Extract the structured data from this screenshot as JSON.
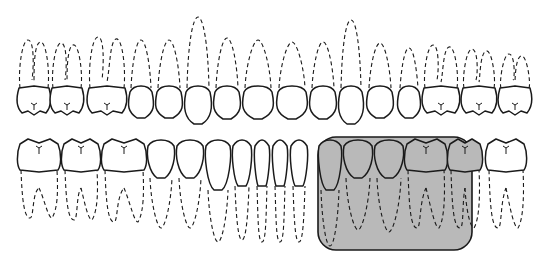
{
  "diagram": {
    "type": "dental-arch-chart",
    "colors": {
      "background": "#ffffff",
      "outline": "#1a1a1a",
      "highlight_fill": "#b9b9b9"
    },
    "upper_arch": {
      "tooth_count": 16,
      "teeth": [
        {
          "x": 18,
          "w": 32,
          "type": "molar",
          "root_top": 40
        },
        {
          "x": 51,
          "w": 32,
          "type": "molar",
          "root_top": 43
        },
        {
          "x": 88,
          "w": 38,
          "type": "molar",
          "root_top": 37
        },
        {
          "x": 128,
          "w": 26,
          "type": "premolar",
          "root_top": 40
        },
        {
          "x": 155,
          "w": 28,
          "type": "premolar",
          "root_top": 40
        },
        {
          "x": 184,
          "w": 28,
          "type": "canine",
          "root_top": 17
        },
        {
          "x": 213,
          "w": 28,
          "type": "incisor",
          "root_top": 38
        },
        {
          "x": 242,
          "w": 32,
          "type": "incisor",
          "root_top": 40
        },
        {
          "x": 276,
          "w": 32,
          "type": "incisor",
          "root_top": 42
        },
        {
          "x": 309,
          "w": 28,
          "type": "incisor",
          "root_top": 42
        },
        {
          "x": 338,
          "w": 26,
          "type": "canine",
          "root_top": 20
        },
        {
          "x": 366,
          "w": 28,
          "type": "premolar",
          "root_top": 43
        },
        {
          "x": 397,
          "w": 24,
          "type": "premolar",
          "root_top": 48
        },
        {
          "x": 423,
          "w": 36,
          "type": "molar",
          "root_top": 45
        },
        {
          "x": 462,
          "w": 34,
          "type": "molar",
          "root_top": 49
        },
        {
          "x": 499,
          "w": 32,
          "type": "molar",
          "root_top": 54
        }
      ]
    },
    "lower_arch": {
      "tooth_count": 16,
      "teeth": [
        {
          "x": 18,
          "w": 42,
          "type": "molar",
          "root_bottom": 218
        },
        {
          "x": 62,
          "w": 38,
          "type": "molar",
          "root_bottom": 220
        },
        {
          "x": 102,
          "w": 44,
          "type": "molar",
          "root_bottom": 222
        },
        {
          "x": 147,
          "w": 28,
          "type": "premolar",
          "root_bottom": 228
        },
        {
          "x": 176,
          "w": 28,
          "type": "premolar",
          "root_bottom": 228
        },
        {
          "x": 205,
          "w": 26,
          "type": "canine",
          "root_bottom": 242
        },
        {
          "x": 232,
          "w": 20,
          "type": "incisor",
          "root_bottom": 240
        },
        {
          "x": 254,
          "w": 16,
          "type": "incisor",
          "root_bottom": 242
        },
        {
          "x": 272,
          "w": 16,
          "type": "incisor",
          "root_bottom": 242
        },
        {
          "x": 290,
          "w": 18,
          "type": "incisor",
          "root_bottom": 242
        },
        {
          "x": 318,
          "w": 24,
          "type": "canine",
          "root_bottom": 246
        },
        {
          "x": 343,
          "w": 30,
          "type": "premolar",
          "root_bottom": 230
        },
        {
          "x": 374,
          "w": 30,
          "type": "premolar",
          "root_bottom": 232
        },
        {
          "x": 405,
          "w": 42,
          "type": "molar",
          "root_bottom": 228
        },
        {
          "x": 448,
          "w": 34,
          "type": "molar",
          "root_bottom": 228
        },
        {
          "x": 486,
          "w": 40,
          "type": "molar",
          "root_bottom": 228
        }
      ]
    },
    "highlight": {
      "label": "highlighted-lower-teeth-region",
      "x": 318,
      "y": 137,
      "width": 154,
      "height": 113,
      "corner_radius": 18,
      "covers_lower_teeth_indices": [
        10,
        11,
        12,
        13,
        14
      ]
    }
  }
}
